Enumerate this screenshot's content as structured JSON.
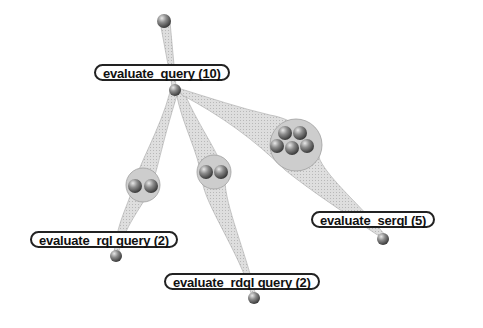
{
  "diagram": {
    "type": "tree",
    "root": {
      "id": "root",
      "label": ""
    },
    "nodes": [
      {
        "id": "evaluate_query",
        "label": "evaluate_query (10)",
        "count": 10
      },
      {
        "id": "evaluate_rql",
        "label": "evaluate_rql query (2)",
        "count": 2
      },
      {
        "id": "evaluate_rdql",
        "label": "evaluate_rdql query (2)",
        "count": 2
      },
      {
        "id": "evaluate_serql",
        "label": "evaluate_serql (5)",
        "count": 5
      }
    ],
    "edges": [
      {
        "from": "root",
        "to": "evaluate_query"
      },
      {
        "from": "evaluate_query",
        "to": "evaluate_rql",
        "bundle_size": 2
      },
      {
        "from": "evaluate_query",
        "to": "evaluate_rdql",
        "bundle_size": 2
      },
      {
        "from": "evaluate_query",
        "to": "evaluate_serql",
        "bundle_size": 5
      }
    ],
    "colors": {
      "edge_fill": "#d6d6d6",
      "edge_stroke": "#9a9a9a",
      "cluster_fill": "#cfcfcf",
      "ball": "#7a7a7a",
      "label_border": "#222222"
    }
  }
}
